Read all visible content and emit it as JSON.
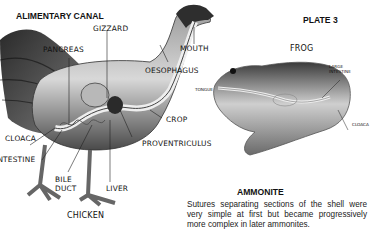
{
  "page": {
    "plate_label": "PLATE 3"
  },
  "chicken_figure": {
    "heading": "ALIMENTARY CANAL",
    "caption": "CHICKEN",
    "labels": {
      "gizzard": "GIZZARD",
      "pancreas": "PANCREAS",
      "mouth": "MOUTH",
      "oesophagus": "OESOPHAGUS",
      "crop": "CROP",
      "proventriculus": "PROVENTRICULUS",
      "cloaca": "CLOACA",
      "intestine": "INTESTINE",
      "bile_duct_line1": "BILE",
      "bile_duct_line2": "DUCT",
      "liver": "LIVER"
    }
  },
  "frog_figure": {
    "caption": "FROG",
    "labels": {
      "large_intestine_line1": "LARGE",
      "large_intestine_line2": "INTESTINE",
      "tongue": "TONGUE",
      "cloaca": "CLOACA"
    }
  },
  "ammonite": {
    "heading": "AMMONITE",
    "text": "Sutures separating sections of the shell were very simple at first but became progressively more complex in later ammonites."
  }
}
